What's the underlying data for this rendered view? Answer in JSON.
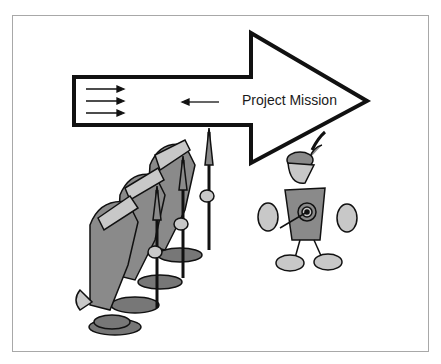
{
  "diagram": {
    "arrow": {
      "label": "Project Mission",
      "direction": "right",
      "inner_arrows_right_count": 3,
      "inner_arrow_left_count": 1
    },
    "figures": {
      "left_group": "soldiers-with-spears",
      "left_group_count": 3,
      "right_figure": "archer-with-target-shirt"
    },
    "colors": {
      "outline": "#111111",
      "fill_gray": "#8a8a8a",
      "light_gray": "#c8c8c8",
      "frame_border": "#a8a8a8",
      "background": "#ffffff"
    }
  }
}
